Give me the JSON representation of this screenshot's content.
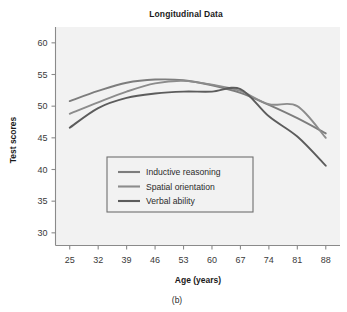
{
  "figure": {
    "title": "Longitudinal Data",
    "caption": "(b)",
    "background": "#ffffff",
    "plot_background": "#f2f2f2",
    "axis_color": "#8a8a8a"
  },
  "chart_data": {
    "type": "line",
    "title": "Longitudinal Data",
    "xlabel": "Age (years)",
    "ylabel": "Test scores",
    "caption": "(b)",
    "grid": false,
    "legend_position": "lower-center-left",
    "x": [
      25,
      32,
      39,
      46,
      53,
      60,
      67,
      74,
      81,
      88
    ],
    "xlim": [
      21.5,
      91.5
    ],
    "ylim": [
      28.0,
      62.5
    ],
    "xticks": [
      25,
      32,
      39,
      46,
      53,
      60,
      67,
      74,
      81,
      88
    ],
    "yticks": [
      30,
      35,
      40,
      45,
      50,
      55,
      60
    ],
    "series": [
      {
        "name": "Inductive reasoning",
        "color": "#7d7d7d",
        "values": [
          50.8,
          52.4,
          53.7,
          54.2,
          54.1,
          53.3,
          52.1,
          50.2,
          48.1,
          45.7
        ]
      },
      {
        "name": "Spatial orientation",
        "color": "#8c8c8c",
        "values": [
          48.8,
          50.6,
          52.3,
          53.6,
          54.0,
          53.4,
          52.4,
          50.3,
          50.0,
          45.0
        ]
      },
      {
        "name": "Verbal ability",
        "color": "#5c5c5c",
        "values": [
          46.6,
          49.7,
          51.3,
          52.0,
          52.3,
          52.3,
          52.7,
          48.4,
          45.2,
          40.6
        ]
      }
    ]
  },
  "legend": {
    "items": [
      {
        "label": "Inductive reasoning",
        "color": "#7d7d7d"
      },
      {
        "label": "Spatial orientation",
        "color": "#8c8c8c"
      },
      {
        "label": "Verbal ability",
        "color": "#5c5c5c"
      }
    ]
  }
}
